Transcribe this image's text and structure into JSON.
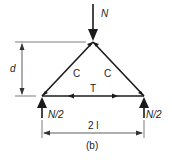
{
  "diagram": {
    "caption": "(b)",
    "load_label": "N",
    "members": {
      "left": "C",
      "right": "C",
      "bottom": "T"
    },
    "reactions": {
      "left": "N/2",
      "right": "N/2"
    },
    "dimensions": {
      "height": "d",
      "span": "2 l"
    },
    "colors": {
      "line": "#1a1a1a",
      "dim": "#333333"
    }
  }
}
